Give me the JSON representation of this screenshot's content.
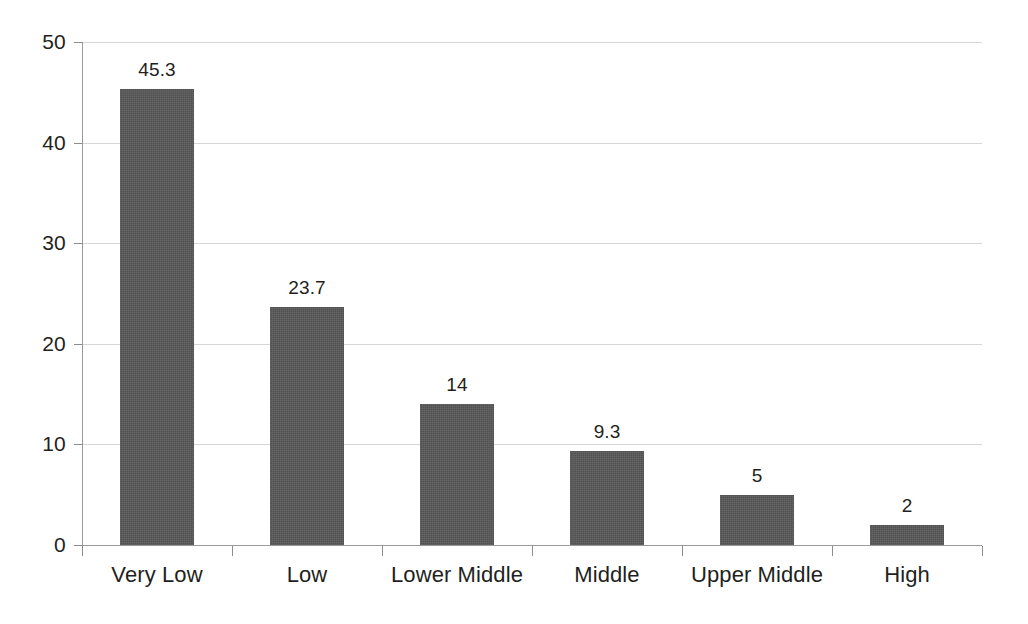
{
  "chart_data": {
    "type": "bar",
    "title": "",
    "subtitle": "",
    "xlabel": "",
    "ylabel": "",
    "categories": [
      "Very Low",
      "Low",
      "Lower Middle",
      "Middle",
      "Upper Middle",
      "High"
    ],
    "values": [
      45.3,
      23.7,
      14,
      9.3,
      5,
      2
    ],
    "value_labels": [
      "45.3",
      "23.7",
      "14",
      "9.3",
      "5",
      "2"
    ],
    "ylim": [
      0,
      50
    ],
    "yticks": [
      0,
      10,
      20,
      30,
      40,
      50
    ],
    "ytick_labels": [
      "0",
      "10",
      "20",
      "30",
      "40",
      "50"
    ],
    "grid": "horizontal",
    "legend": "none",
    "series": [
      {
        "name": "",
        "values": [
          45.3,
          23.7,
          14,
          9.3,
          5,
          2
        ]
      }
    ],
    "colors": {
      "bar_fill": "#575757",
      "gridline": "#d6d6d6",
      "axis_line": "#9a9a9a",
      "text": "#231f20",
      "background": "#ffffff"
    }
  }
}
